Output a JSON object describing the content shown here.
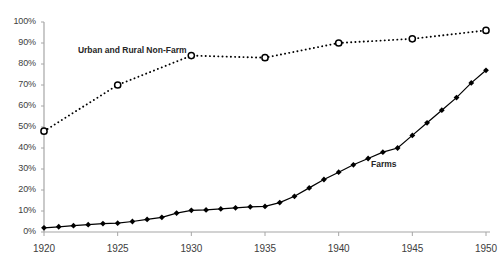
{
  "chart_data": {
    "type": "line",
    "title": "",
    "subtitle": "",
    "xlabel": "",
    "ylabel": "",
    "xlim": [
      1920,
      1950
    ],
    "ylim": [
      0,
      100
    ],
    "y_tick_labels": [
      "0%",
      "10%",
      "20%",
      "30%",
      "40%",
      "50%",
      "60%",
      "70%",
      "80%",
      "90%",
      "100%"
    ],
    "y_ticks": [
      0,
      10,
      20,
      30,
      40,
      50,
      60,
      70,
      80,
      90,
      100
    ],
    "x_tick_labels": [
      "1920",
      "1925",
      "1930",
      "1935",
      "1940",
      "1945",
      "1950"
    ],
    "x_ticks": [
      1920,
      1925,
      1930,
      1935,
      1940,
      1945,
      1950
    ],
    "grid": false,
    "legend": "inline-annotations",
    "series": [
      {
        "name": "Urban and Rural Non-Farm",
        "marker": "open-circle",
        "linestyle": "dotted",
        "color": "#000000",
        "label_x": 1922.3,
        "label_y": 86,
        "x": [
          1920,
          1925,
          1930,
          1935,
          1940,
          1945,
          1950
        ],
        "values": [
          48,
          70,
          84,
          83,
          90,
          92,
          96
        ]
      },
      {
        "name": "Farms",
        "marker": "filled-diamond",
        "linestyle": "solid",
        "color": "#000000",
        "label_x": 1942.2,
        "label_y": 32,
        "x": [
          1920,
          1921,
          1922,
          1923,
          1924,
          1925,
          1926,
          1927,
          1928,
          1929,
          1930,
          1931,
          1932,
          1933,
          1934,
          1935,
          1936,
          1937,
          1938,
          1939,
          1940,
          1941,
          1942,
          1943,
          1944,
          1945,
          1946,
          1947,
          1948,
          1949,
          1950
        ],
        "values": [
          2,
          2.5,
          3,
          3.5,
          4,
          4.2,
          5,
          6,
          7,
          9,
          10.3,
          10.5,
          11,
          11.5,
          12,
          12.2,
          14,
          17,
          21,
          25,
          28.5,
          32,
          35,
          38,
          40,
          46,
          52,
          58,
          64,
          71,
          77
        ]
      }
    ]
  },
  "axis": {
    "y_labels": [
      "100%",
      "90%",
      "80%",
      "70%",
      "60%",
      "50%",
      "40%",
      "30%",
      "20%",
      "10%",
      "0%"
    ],
    "x_labels": [
      "1920",
      "1925",
      "1930",
      "1935",
      "1940",
      "1945",
      "1950"
    ]
  },
  "annotations": {
    "urban_label": "Urban and Rural Non-Farm",
    "farms_label": "Farms"
  },
  "colors": {
    "line": "#000000",
    "axis": "#a6a6a6",
    "text": "#404040",
    "background": "#ffffff"
  }
}
